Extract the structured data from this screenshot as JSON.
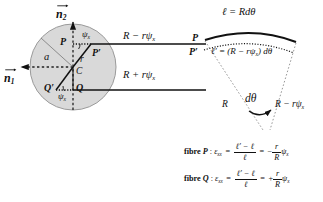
{
  "figure": {
    "caption_none": "",
    "cross_section": {
      "vector_n2": "n",
      "vector_n2_sub": "2",
      "vector_n1": "n",
      "vector_n1_sub": "1",
      "point_P": "P",
      "point_P_prime": "P′",
      "point_Q": "Q",
      "point_Q_prime": "Q′",
      "center_C": "C",
      "radius_a": "a",
      "radius_r": "r",
      "angle_psi_top": "ψ",
      "angle_psi_top_sub": "x",
      "angle_psi_bottom": "ψ",
      "angle_psi_bottom_sub": "x"
    },
    "arrows": {
      "upper_label_main": "R − rψ",
      "upper_label_sub": "x",
      "lower_label_main": "R + rψ",
      "lower_label_sub": "x"
    },
    "arc_diagram": {
      "outer_arc_label": "ℓ = Rdθ",
      "inner_arc_label_lhs": "ℓ′ = ",
      "inner_arc_label_paren": "(R − rψ",
      "inner_arc_label_sub": "x",
      "inner_arc_label_tail": ") dθ",
      "point_P": "P",
      "point_P_prime": "P′",
      "radius_label": "R",
      "angle_label": "dθ",
      "right_radius_main": "R − rψ",
      "right_radius_sub": "x"
    },
    "equations": [
      {
        "name": "fibre-P-strain",
        "prefix_bold": "fibre ",
        "fibre_letter": "P",
        "colon": " : ",
        "strain_symbol": "ε",
        "strain_sub": "xx",
        "eq1": " = ",
        "frac1_num": "ℓ′ − ℓ",
        "frac1_den": "ℓ",
        "eq2": " = ",
        "sign": "−",
        "frac2_num": "r",
        "frac2_den": "R",
        "trailing_symbol": "ψ",
        "trailing_sub": "x"
      },
      {
        "name": "fibre-Q-strain",
        "prefix_bold": "fibre ",
        "fibre_letter": "Q",
        "colon": " : ",
        "strain_symbol": "ε",
        "strain_sub": "xx",
        "eq1": " = ",
        "frac1_num": "ℓ′ − ℓ",
        "frac1_den": "ℓ",
        "eq2": " = ",
        "sign": "+",
        "frac2_num": "r",
        "frac2_den": "R",
        "trailing_symbol": "ψ",
        "trailing_sub": "x"
      }
    ],
    "colors": {
      "ink": "#111111",
      "disc_fill": "#d9d9d9",
      "disc_edge": "#8a8a8a",
      "background": "#ffffff"
    }
  }
}
